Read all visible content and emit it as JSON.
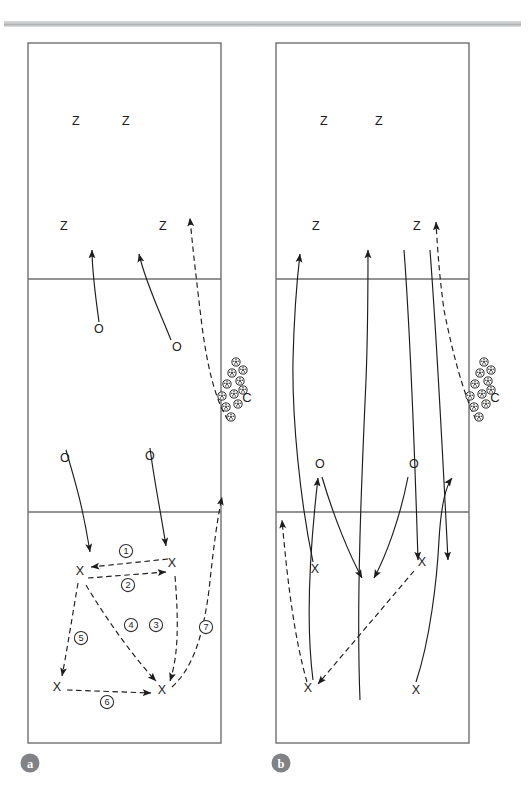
{
  "figure": {
    "type": "volleyball-drill-diagram",
    "panels": [
      {
        "id": "a",
        "badge_label": "a",
        "court": {
          "x": 28,
          "y": 43,
          "w": 193,
          "h": 700,
          "attack_line_top_y": 279,
          "attack_line_bottom_y": 512
        },
        "players": [
          {
            "label": "Z",
            "x": 76,
            "y": 122
          },
          {
            "label": "Z",
            "x": 126,
            "y": 122
          },
          {
            "label": "Z",
            "x": 64,
            "y": 227
          },
          {
            "label": "Z",
            "x": 163,
            "y": 227
          },
          {
            "label": "O",
            "x": 99,
            "y": 330
          },
          {
            "label": "O",
            "x": 177,
            "y": 348
          },
          {
            "label": "O",
            "x": 65,
            "y": 459
          },
          {
            "label": "O",
            "x": 150,
            "y": 457
          },
          {
            "label": "X",
            "x": 80,
            "y": 572
          },
          {
            "label": "X",
            "x": 172,
            "y": 564
          },
          {
            "label": "X",
            "x": 57,
            "y": 688
          },
          {
            "label": "X",
            "x": 162,
            "y": 691
          }
        ],
        "coach": {
          "label": "C",
          "x": 247,
          "y": 399
        },
        "ball_cart": {
          "ball_count": 11,
          "balls": [
            {
              "x": 232,
              "y": 373
            },
            {
              "x": 243,
              "y": 370
            },
            {
              "x": 227,
              "y": 384
            },
            {
              "x": 240,
              "y": 381
            },
            {
              "x": 222,
              "y": 396
            },
            {
              "x": 234,
              "y": 394
            },
            {
              "x": 226,
              "y": 407
            },
            {
              "x": 238,
              "y": 404
            },
            {
              "x": 231,
              "y": 417
            },
            {
              "x": 243,
              "y": 390
            },
            {
              "x": 236,
              "y": 362
            }
          ]
        },
        "sequence_markers": [
          {
            "number": "1",
            "x": 126,
            "y": 551
          },
          {
            "number": "2",
            "x": 128,
            "y": 585
          },
          {
            "number": "3",
            "x": 156,
            "y": 625
          },
          {
            "number": "4",
            "x": 131,
            "y": 625
          },
          {
            "number": "5",
            "x": 81,
            "y": 638
          },
          {
            "number": "6",
            "x": 107,
            "y": 702
          },
          {
            "number": "7",
            "x": 206,
            "y": 627
          }
        ]
      },
      {
        "id": "b",
        "badge_label": "b",
        "court": {
          "x": 276,
          "y": 43,
          "w": 193,
          "h": 700,
          "attack_line_top_y": 279,
          "attack_line_bottom_y": 512
        },
        "players": [
          {
            "label": "Z",
            "x": 324,
            "y": 122
          },
          {
            "label": "Z",
            "x": 379,
            "y": 122
          },
          {
            "label": "Z",
            "x": 316,
            "y": 227
          },
          {
            "label": "Z",
            "x": 417,
            "y": 227
          },
          {
            "label": "O",
            "x": 320,
            "y": 465
          },
          {
            "label": "O",
            "x": 414,
            "y": 465
          },
          {
            "label": "X",
            "x": 315,
            "y": 570
          },
          {
            "label": "X",
            "x": 422,
            "y": 563
          },
          {
            "label": "X",
            "x": 308,
            "y": 689
          },
          {
            "label": "X",
            "x": 416,
            "y": 691
          }
        ],
        "coach": {
          "label": "C",
          "x": 495,
          "y": 399
        },
        "ball_cart": {
          "ball_count": 11,
          "balls": [
            {
              "x": 480,
              "y": 373
            },
            {
              "x": 491,
              "y": 370
            },
            {
              "x": 475,
              "y": 384
            },
            {
              "x": 488,
              "y": 381
            },
            {
              "x": 470,
              "y": 396
            },
            {
              "x": 482,
              "y": 394
            },
            {
              "x": 474,
              "y": 407
            },
            {
              "x": 486,
              "y": 404
            },
            {
              "x": 479,
              "y": 417
            },
            {
              "x": 491,
              "y": 390
            },
            {
              "x": 484,
              "y": 362
            }
          ]
        },
        "sequence_markers": []
      }
    ],
    "legend_keys": {
      "Z": "blocker/attacker position marker",
      "O": "passer position marker",
      "X": "defender position marker",
      "C": "coach",
      "ball": "volleyball"
    },
    "paths": {
      "panel_a_solid": [
        "M 99 322 C 96 300 92 270 92 248",
        "M 171 340 C 160 312 146 282 138 252",
        "M 64 450 C 72 476 80 500 88 556",
        "M 150 448 C 154 480 160 506 168 548"
      ],
      "panel_a_dashed": [
        "M 227 418 C 214 400 206 362 200 320 C 196 286 192 254 189 216",
        "M 170 560 L 92 568",
        "M 90 578 L 168 572",
        "M 175 576 C 178 630 178 660 170 684",
        "M 88 584 C 110 622 138 662 158 684",
        "M 76 584 C 70 628 66 660 62 678",
        "M 66 690 L 152 693",
        "M 172 686 C 192 668 202 636 208 590 C 212 552 216 520 222 496"
      ],
      "panel_b_solid": [
        "M 313 560 C 300 500 292 420 292 360 C 292 318 294 290 298 252",
        "M 320 475 C 334 520 352 560 364 580",
        "M 406 475 C 398 520 382 560 372 580",
        "M 368 250 C 368 330 364 440 358 560",
        "M 320 555 C 320 520 320 495 320 478",
        "M 418 555 C 418 520 418 495 418 478",
        "M 416 682 C 430 640 436 580 438 540 C 440 490 442 440 446 400",
        "M 313 680 C 306 630 308 560 312 500",
        "M 428 250 C 430 320 436 420 440 560"
      ],
      "panel_b_dashed": [
        "M 474 418 C 460 390 450 350 442 310 C 438 280 436 260 434 224",
        "M 414 570 L 316 684",
        "M 308 682 C 296 640 288 590 282 534"
      ]
    }
  }
}
